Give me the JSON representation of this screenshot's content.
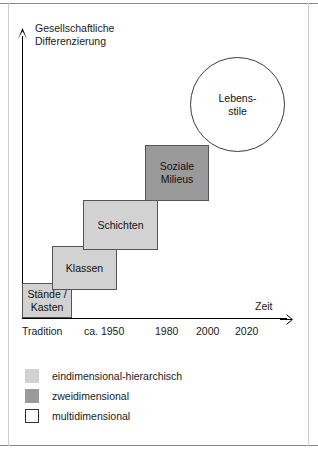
{
  "figure": {
    "axes": {
      "y_label": "Gesellschaftliche\nDifferenzierung",
      "x_label": "Zeit",
      "y_arrow_icon": "arrow-up-icon",
      "x_arrow_icon": "arrow-right-icon"
    },
    "time_ticks": [
      {
        "label": "Tradition",
        "x": 22
      },
      {
        "label": "ca. 1950",
        "x": 84
      },
      {
        "label": "1980",
        "x": 155
      },
      {
        "label": "2000",
        "x": 196
      },
      {
        "label": "2020",
        "x": 235
      }
    ],
    "steps": [
      {
        "label": "Stände /\nKasten",
        "fill": "#d2d2d2",
        "category": "eindimensional-hierarchisch",
        "x": 22,
        "y": 283,
        "w": 50,
        "h": 35
      },
      {
        "label": "Klassen",
        "fill": "#d2d2d2",
        "category": "eindimensional-hierarchisch",
        "x": 52,
        "y": 246,
        "w": 65,
        "h": 44
      },
      {
        "label": "Schichten",
        "fill": "#d2d2d2",
        "category": "eindimensional-hierarchisch",
        "x": 83,
        "y": 200,
        "w": 75,
        "h": 50
      },
      {
        "label": "Soziale\nMilieus",
        "fill": "#9a9a9a",
        "category": "zweidimensional",
        "x": 145,
        "y": 145,
        "w": 64,
        "h": 56
      }
    ],
    "circle": {
      "label": "Lebens-\nstile",
      "fill": "#ffffff",
      "category": "multidimensional"
    },
    "legend": [
      {
        "label": "eindimensional-hierarchisch",
        "fill": "#d2d2d2",
        "border": "#d2d2d2"
      },
      {
        "label": "zweidimensional",
        "fill": "#9a9a9a",
        "border": "#9a9a9a"
      },
      {
        "label": "multidimensional",
        "fill": "#ffffff",
        "border": "#333333"
      }
    ]
  },
  "colors": {
    "light_gray": "#d2d2d2",
    "dark_gray": "#9a9a9a",
    "white": "#ffffff",
    "line": "#000000"
  }
}
